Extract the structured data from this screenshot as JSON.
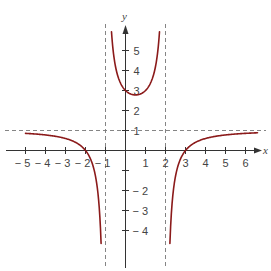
{
  "chart_data": {
    "type": "line",
    "title": "",
    "xlabel": "x",
    "ylabel": "y",
    "xlim": [
      -5.5,
      6.9
    ],
    "ylim": [
      -5.9,
      6.0
    ],
    "grid": false,
    "x_ticks": [
      {
        "value": -5,
        "label": "− 5"
      },
      {
        "value": -4,
        "label": "− 4"
      },
      {
        "value": -3,
        "label": "− 3"
      },
      {
        "value": -2,
        "label": "− 2"
      },
      {
        "value": -1,
        "label": "− 1"
      },
      {
        "value": 1,
        "label": "1"
      },
      {
        "value": 2,
        "label": "2"
      },
      {
        "value": 3,
        "label": "3"
      },
      {
        "value": 4,
        "label": "4"
      },
      {
        "value": 5,
        "label": "5"
      },
      {
        "value": 6,
        "label": "6"
      }
    ],
    "y_ticks": [
      {
        "value": 5,
        "label": "5"
      },
      {
        "value": 4,
        "label": "4"
      },
      {
        "value": 3,
        "label": "3"
      },
      {
        "value": 2,
        "label": "2"
      },
      {
        "value": 1,
        "label": "1"
      },
      {
        "value": -1,
        "label": ""
      },
      {
        "value": -2,
        "label": "− 2"
      },
      {
        "value": -3,
        "label": "− 3"
      },
      {
        "value": -4,
        "label": "− 4"
      }
    ],
    "asymptotes": {
      "vertical": [
        -1,
        2
      ],
      "horizontal": [
        1
      ]
    },
    "curve_color": "#8b1a1a",
    "series": [
      {
        "name": "left-branch",
        "points": [
          [
            -5,
            0.857
          ],
          [
            -4.5,
            0.826
          ],
          [
            -4,
            0.778
          ],
          [
            -3.5,
            0.704
          ],
          [
            -3,
            0.6
          ],
          [
            -2.5,
            0.407
          ],
          [
            -2.25,
            0.23
          ],
          [
            -2,
            0
          ],
          [
            -1.85,
            -0.2
          ],
          [
            -1.75,
            -0.049
          ],
          [
            -1.6,
            -0.7
          ],
          [
            -1.5,
            -1.286
          ],
          [
            -1.4,
            -1.94
          ],
          [
            -1.3,
            -3.04
          ],
          [
            -1.25,
            -3.92
          ],
          [
            -1.22,
            -4.5
          ]
        ]
      },
      {
        "name": "middle-branch",
        "points": [
          [
            -0.7,
            5.94
          ],
          [
            -0.6,
            5.05
          ],
          [
            -0.5,
            4.2
          ],
          [
            -0.3,
            3.47
          ],
          [
            0,
            3
          ],
          [
            0.25,
            2.83
          ],
          [
            0.5,
            2.78
          ],
          [
            0.75,
            2.83
          ],
          [
            1,
            3
          ],
          [
            1.3,
            3.47
          ],
          [
            1.5,
            4.2
          ],
          [
            1.6,
            5.05
          ],
          [
            1.7,
            5.94
          ]
        ]
      },
      {
        "name": "right-branch",
        "points": [
          [
            2.22,
            -4.5
          ],
          [
            2.25,
            -3.92
          ],
          [
            2.3,
            -3.04
          ],
          [
            2.4,
            -1.94
          ],
          [
            2.5,
            -1.286
          ],
          [
            2.6,
            -0.7
          ],
          [
            2.75,
            -0.2
          ],
          [
            3,
            0
          ],
          [
            3.25,
            0.23
          ],
          [
            3.5,
            0.407
          ],
          [
            4,
            0.6
          ],
          [
            4.5,
            0.704
          ],
          [
            5,
            0.778
          ],
          [
            5.5,
            0.826
          ],
          [
            6,
            0.857
          ],
          [
            6.6,
            0.892
          ]
        ]
      }
    ],
    "function_note": "f(x) = (x+2)(x-3) / ((x+1)(x-2))",
    "key_points": {
      "y_intercept": [
        0,
        3
      ],
      "x_intercepts": [
        [
          -2,
          0
        ],
        [
          3,
          0
        ]
      ]
    }
  }
}
